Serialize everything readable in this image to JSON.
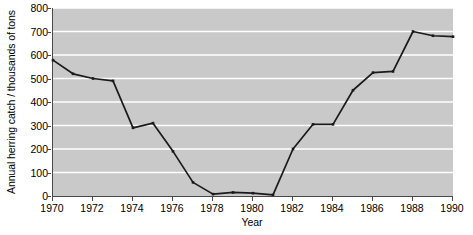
{
  "chart_data": {
    "type": "line",
    "title": "",
    "xlabel": "Year",
    "ylabel": "Annual herring catch / thousands of tons",
    "xlim": [
      1970,
      1990
    ],
    "ylim": [
      0,
      800
    ],
    "grid": "horizontal",
    "legend": "none",
    "xticks": [
      1970,
      1972,
      1974,
      1976,
      1978,
      1980,
      1982,
      1984,
      1986,
      1988,
      1990
    ],
    "yticks": [
      0,
      100,
      200,
      300,
      400,
      500,
      600,
      700,
      800
    ],
    "x": [
      1970,
      1971,
      1972,
      1973,
      1974,
      1975,
      1976,
      1977,
      1978,
      1979,
      1980,
      1981,
      1982,
      1983,
      1984,
      1985,
      1986,
      1987,
      1988,
      1989,
      1990
    ],
    "values": [
      578,
      520,
      500,
      490,
      290,
      310,
      190,
      58,
      8,
      15,
      12,
      5,
      200,
      305,
      305,
      450,
      525,
      530,
      700,
      682,
      678
    ],
    "series_name": "Annual herring catch",
    "line_color": "#1a1a1a",
    "marker_color": "#1a1a1a",
    "plot_background": "#c9c9c9",
    "gridline_color": "#ffffff",
    "axis_color": "#4a4a4a",
    "figure_background": "#ffffff"
  }
}
